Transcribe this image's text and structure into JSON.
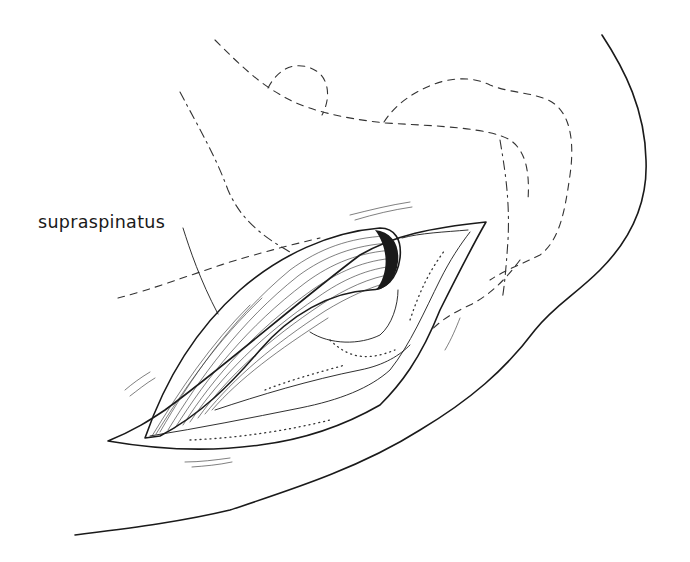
{
  "figure": {
    "type": "anatomical line drawing",
    "style": "black ink on white",
    "labels": [
      {
        "text": "supraspinatus",
        "target": "muscle belly retracted through incision"
      }
    ]
  },
  "colors": {
    "background": "#ffffff",
    "ink": "#1a1a1a"
  }
}
